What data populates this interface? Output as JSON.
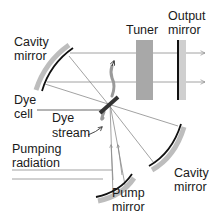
{
  "labels": {
    "cavity_mirror_left_line1": "Cavity",
    "cavity_mirror_left_line2": "mirror",
    "tuner": "Tuner",
    "output_mirror_line1": "Output",
    "output_mirror_line2": "mirror",
    "dye_cell_line1": "Dye",
    "dye_cell_line2": "cell",
    "dye_stream_line1": "Dye",
    "dye_stream_line2": "stream",
    "pumping_radiation_line1": "Pumping",
    "pumping_radiation_line2": "radiation",
    "pump_mirror_line1": "Pump",
    "pump_mirror_line2": "mirror",
    "cavity_mirror_right_line1": "Cavity",
    "cavity_mirror_right_line2": "mirror"
  },
  "colors": {
    "mirror_shade": "#bdbdbd",
    "tuner": "#a8a8a8",
    "output_mirror_shade": "#cfcfcf",
    "beam": "#8a8a8a",
    "dye_stream": "#9a9a9a",
    "ink": "#1a1a1a"
  }
}
